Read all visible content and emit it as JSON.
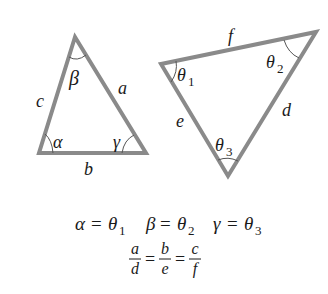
{
  "diagram": {
    "stroke_color": "#8a8a8a",
    "text_color": "#1a1a1a",
    "triangle1": {
      "vertices": [
        [
          75,
          37
        ],
        [
          39,
          153
        ],
        [
          146,
          153
        ]
      ],
      "sides": {
        "a": "a",
        "b": "b",
        "c": "c"
      },
      "angles": {
        "alpha": "α",
        "beta": "β",
        "gamma": "γ"
      }
    },
    "triangle2": {
      "vertices": [
        [
          161,
          64
        ],
        [
          316,
          32
        ],
        [
          228,
          176
        ]
      ],
      "sides": {
        "d": "d",
        "e": "e",
        "f": "f"
      },
      "angles": {
        "theta1": {
          "sym": "θ",
          "sub": "1"
        },
        "theta2": {
          "sym": "θ",
          "sub": "2"
        },
        "theta3": {
          "sym": "θ",
          "sub": "3"
        }
      }
    },
    "equations": {
      "line1": [
        {
          "lhs": "α",
          "eq": "=",
          "rhs": "θ",
          "sub": "1"
        },
        {
          "lhs": "β",
          "eq": "=",
          "rhs": "θ",
          "sub": "2"
        },
        {
          "lhs": "γ",
          "eq": "=",
          "rhs": "θ",
          "sub": "3"
        }
      ],
      "line2": {
        "fractions": [
          {
            "num": "a",
            "den": "d"
          },
          {
            "num": "b",
            "den": "e"
          },
          {
            "num": "c",
            "den": "f"
          }
        ],
        "eq": "="
      }
    }
  }
}
